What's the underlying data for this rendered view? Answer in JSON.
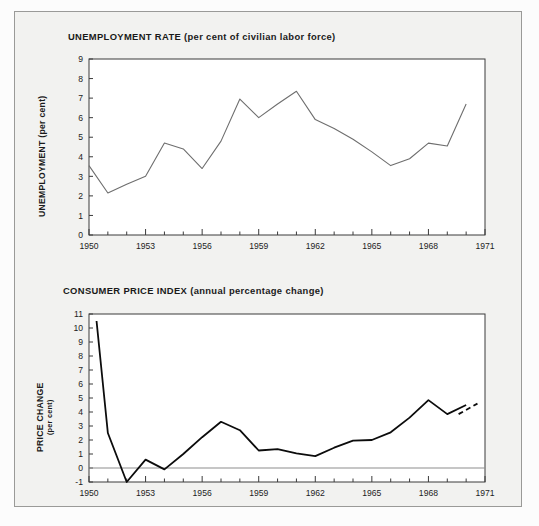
{
  "page": {
    "background": "#fcfcfc",
    "panel_background": "#f2f2f0",
    "panel_border": "#9a9a98"
  },
  "chart_data": [
    {
      "id": "unemployment",
      "type": "line",
      "title": "UNEMPLOYMENT RATE (per cent of civilian labor force)",
      "title_main": "UNEMPLOYMENT RATE",
      "title_sub": "(per cent of civilian labor force)",
      "xlabel": "",
      "ylabel": "UNEMPLOYMENT (per cent)",
      "xlim": [
        1950,
        1971
      ],
      "ylim": [
        0,
        9
      ],
      "ytick_labels": [
        "9",
        "8",
        "7",
        "6",
        "5",
        "4",
        "3",
        "2",
        "1",
        "0"
      ],
      "yticks": [
        9,
        8,
        7,
        6,
        5,
        4,
        3,
        2,
        1,
        0
      ],
      "xtick_labels": [
        "1950",
        "1953",
        "1956",
        "1959",
        "1962",
        "1965",
        "1968",
        "1971"
      ],
      "xticks": [
        1950,
        1953,
        1956,
        1959,
        1962,
        1965,
        1968,
        1971
      ],
      "xtick_minor_step": 1,
      "grid": false,
      "legend": "none",
      "line_color": "#6e6e6e",
      "x": [
        1950,
        1951,
        1952,
        1953,
        1954,
        1955,
        1956,
        1957,
        1958,
        1959,
        1960,
        1961,
        1962,
        1963,
        1964,
        1965,
        1966,
        1967,
        1968,
        1969,
        1970
      ],
      "values": [
        3.55,
        2.15,
        2.6,
        3.0,
        4.7,
        4.4,
        3.4,
        4.8,
        6.95,
        6.0,
        6.7,
        7.35,
        5.9,
        5.45,
        4.9,
        4.25,
        3.55,
        3.9,
        4.7,
        4.55,
        6.7
      ]
    },
    {
      "id": "consumer-price-index",
      "type": "line",
      "title": "CONSUMER PRICE INDEX (annual percentage change)",
      "title_main": "CONSUMER PRICE INDEX",
      "title_sub": "(annual percentage change)",
      "xlabel": "",
      "ylabel": "PRICE CHANGE",
      "ylabel_sub": "(per cent)",
      "xlim": [
        1950,
        1971
      ],
      "ylim": [
        -1,
        11
      ],
      "ytick_labels": [
        "11",
        "10",
        "9",
        "8",
        "7",
        "6",
        "5",
        "4",
        "3",
        "2",
        "1",
        "0",
        "-1"
      ],
      "yticks": [
        11,
        10,
        9,
        8,
        7,
        6,
        5,
        4,
        3,
        2,
        1,
        0,
        -1
      ],
      "xtick_labels": [
        "1950",
        "1953",
        "1956",
        "1959",
        "1962",
        "1965",
        "1968",
        "1971"
      ],
      "xticks": [
        1950,
        1953,
        1956,
        1959,
        1962,
        1965,
        1968,
        1971
      ],
      "xtick_minor_step": 1,
      "grid": false,
      "zero_line": true,
      "legend": "none",
      "line_color": "#0c0c0c",
      "x": [
        1950.4,
        1951,
        1952,
        1953,
        1954,
        1955,
        1956,
        1957,
        1958,
        1959,
        1960,
        1961,
        1962,
        1963,
        1964,
        1965,
        1966,
        1967,
        1968,
        1969,
        1970
      ],
      "values": [
        10.5,
        2.5,
        -1.0,
        0.6,
        -0.1,
        1.0,
        2.2,
        3.3,
        2.7,
        1.25,
        1.35,
        1.05,
        0.85,
        1.45,
        1.95,
        2.0,
        2.55,
        3.6,
        4.85,
        3.85,
        4.5
      ],
      "projection_x": [
        1969.6,
        1970.6
      ],
      "projection_values": [
        3.85,
        4.6
      ],
      "projection_style": "dashed"
    }
  ]
}
